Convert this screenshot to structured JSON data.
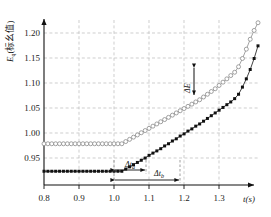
{
  "chart_data": {
    "type": "line",
    "title": "",
    "xlabel": "t(s)",
    "ylabel": "E_q(标幺值)",
    "ylabel_main": "E",
    "ylabel_sub": "q",
    "ylabel_paren": "(标幺值)",
    "xlim": [
      0.8,
      1.35
    ],
    "ylim": [
      0.925,
      1.225
    ],
    "grid": true,
    "legend": "none",
    "xticks": [
      "0.8",
      "0.9",
      "1.0",
      "1.1",
      "1.2",
      "1.3"
    ],
    "xtick_values": [
      0.8,
      0.9,
      1.0,
      1.1,
      1.2,
      1.3
    ],
    "yticks": [
      "0.95",
      "1.00",
      "1.05",
      "1.10",
      "1.15",
      "1.20"
    ],
    "ytick_values": [
      0.95,
      1.0,
      1.05,
      1.1,
      1.15,
      1.2
    ],
    "series": [
      {
        "name": "open-circle-series",
        "marker": "open-circle",
        "color": "#8a8a8a",
        "x": [
          0.8,
          0.81,
          0.82,
          0.83,
          0.84,
          0.85,
          0.86,
          0.87,
          0.88,
          0.89,
          0.9,
          0.91,
          0.92,
          0.93,
          0.94,
          0.95,
          0.96,
          0.97,
          0.98,
          0.99,
          1.0,
          1.01,
          1.02,
          1.03,
          1.04,
          1.05,
          1.06,
          1.07,
          1.08,
          1.09,
          1.1,
          1.11,
          1.12,
          1.13,
          1.14,
          1.15,
          1.16,
          1.17,
          1.18,
          1.19,
          1.2,
          1.21,
          1.22,
          1.23,
          1.24,
          1.25,
          1.26,
          1.27,
          1.28,
          1.29,
          1.3,
          1.31,
          1.32,
          1.33,
          1.34,
          1.35
        ],
        "values": [
          1.0,
          1.0,
          1.0,
          1.0,
          1.0,
          1.0,
          1.0,
          1.0,
          1.0,
          1.0,
          1.0,
          1.0,
          1.0,
          1.0,
          1.0,
          1.0,
          1.0,
          1.0,
          1.0,
          1.0,
          1.0,
          1.004,
          1.008,
          1.012,
          1.016,
          1.02,
          1.024,
          1.028,
          1.032,
          1.036,
          1.04,
          1.044,
          1.048,
          1.052,
          1.056,
          1.06,
          1.064,
          1.068,
          1.072,
          1.076,
          1.08,
          1.085,
          1.09,
          1.095,
          1.1,
          1.106,
          1.112,
          1.118,
          1.124,
          1.13,
          1.14,
          1.155,
          1.172,
          1.19,
          1.206,
          1.22
        ]
      },
      {
        "name": "filled-square-series",
        "marker": "filled-square",
        "color": "#111111",
        "x": [
          0.8,
          0.81,
          0.82,
          0.83,
          0.84,
          0.85,
          0.86,
          0.87,
          0.88,
          0.89,
          0.9,
          0.91,
          0.92,
          0.93,
          0.94,
          0.95,
          0.96,
          0.97,
          0.98,
          0.99,
          1.0,
          1.01,
          1.02,
          1.03,
          1.04,
          1.05,
          1.06,
          1.07,
          1.08,
          1.09,
          1.1,
          1.11,
          1.12,
          1.13,
          1.14,
          1.15,
          1.16,
          1.17,
          1.18,
          1.19,
          1.2,
          1.21,
          1.22,
          1.23,
          1.24,
          1.25,
          1.26,
          1.27,
          1.28,
          1.29,
          1.3,
          1.31,
          1.32,
          1.33,
          1.34,
          1.35
        ],
        "values": [
          0.95,
          0.95,
          0.95,
          0.95,
          0.95,
          0.95,
          0.95,
          0.95,
          0.95,
          0.95,
          0.95,
          0.95,
          0.95,
          0.95,
          0.95,
          0.95,
          0.95,
          0.95,
          0.95,
          0.95,
          0.95,
          0.954,
          0.958,
          0.962,
          0.966,
          0.97,
          0.974,
          0.979,
          0.983,
          0.987,
          0.991,
          0.996,
          1.0,
          1.005,
          1.009,
          1.014,
          1.018,
          1.023,
          1.027,
          1.032,
          1.036,
          1.041,
          1.046,
          1.051,
          1.056,
          1.061,
          1.066,
          1.071,
          1.076,
          1.082,
          1.09,
          1.103,
          1.118,
          1.135,
          1.155,
          1.178
        ]
      }
    ],
    "annotations": [
      {
        "name": "delta-t-a",
        "label": "Δt",
        "sub": "a",
        "x_start": 1.0,
        "x_end": 1.09,
        "kind": "horizontal-double-arrow"
      },
      {
        "name": "delta-t-b",
        "label": "Δt",
        "sub": "b",
        "x_start": 1.0,
        "x_end": 1.17,
        "kind": "horizontal-double-arrow"
      },
      {
        "name": "delta-e",
        "label": "ΔE",
        "sub": "",
        "x": 1.225,
        "y_start": 1.085,
        "y_end": 1.132,
        "kind": "vertical-double-arrow"
      }
    ]
  }
}
